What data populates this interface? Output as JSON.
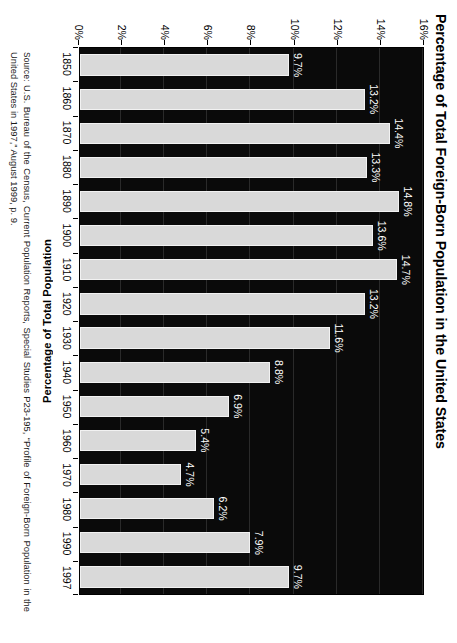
{
  "chart_data": {
    "type": "bar",
    "title": "Percentage of Total Foreign-Born Population in the United States",
    "xlabel": "",
    "ylabel": "Percentage of Total Population",
    "categories": [
      "1850",
      "1860",
      "1870",
      "1880",
      "1890",
      "1900",
      "1910",
      "1920",
      "1930",
      "1940",
      "1950",
      "1960",
      "1970",
      "1980",
      "1990",
      "1997"
    ],
    "values": [
      9.7,
      13.2,
      14.4,
      13.3,
      14.8,
      13.6,
      14.7,
      13.2,
      11.6,
      8.8,
      6.9,
      5.4,
      4.7,
      6.2,
      7.9,
      9.7
    ],
    "data_labels": [
      "9.7%",
      "13.2%",
      "14.4%",
      "13.3%",
      "14.8%",
      "13.6%",
      "14.7%",
      "13.2%",
      "11.6%",
      "8.8%",
      "6.9%",
      "5.4%",
      "4.7%",
      "6.2%",
      "7.9%",
      "9.7%"
    ],
    "ylim": [
      0,
      16
    ],
    "ytick_values": [
      0,
      2,
      4,
      6,
      8,
      10,
      12,
      14,
      16
    ],
    "ytick_labels": [
      "0%",
      "2%",
      "4%",
      "6%",
      "8%",
      "10%",
      "12%",
      "14%",
      "16%"
    ],
    "grid": true,
    "legend": "none",
    "plot_background_color": "#0a0a0a",
    "bar_color": "#d9d9d9",
    "label_color": "#ffffff",
    "page_background_color": "#ffffff"
  },
  "source": {
    "prefix": "Source:",
    "text": " U.S. Bureau of the Census, Current Population Reports, Special Studies P23-195, “Profile of Foreign-Born Population in the United States in 1997,” August 1999, p. 9."
  }
}
